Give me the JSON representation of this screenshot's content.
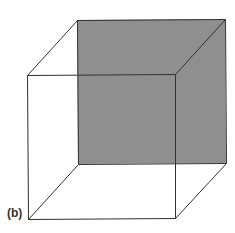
{
  "figure": {
    "label": "(b)",
    "colors": {
      "background": "#ffffff",
      "edge": "#333333",
      "shaded_face": "#8f8f8f"
    },
    "vertices": {
      "front_top_left": [
        27,
        75
      ],
      "front_top_right": [
        175,
        74
      ],
      "front_bottom_left": [
        28,
        219
      ],
      "front_bottom_right": [
        175,
        218
      ],
      "back_top_left": [
        77,
        20
      ],
      "back_top_right": [
        225,
        19
      ],
      "back_bottom_left": [
        78,
        164
      ],
      "back_bottom_right": [
        226,
        163
      ]
    },
    "shaded_face": "back"
  }
}
